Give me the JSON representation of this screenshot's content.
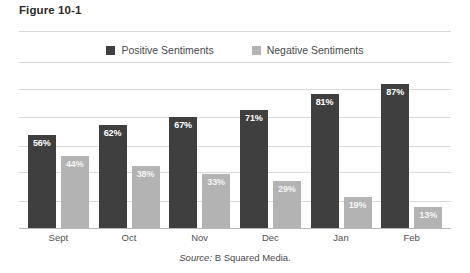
{
  "figure": {
    "title": "Figure 10-1",
    "source_keyword": "Source:",
    "source_text": " B Squared Media."
  },
  "colors": {
    "positive": "#3f3f3f",
    "negative": "#b3b3b3",
    "gridline": "#d9d9d9",
    "axis": "#b9b9b9",
    "background": "#ffffff",
    "label_text": "#ffffff"
  },
  "legend": {
    "items": [
      {
        "label": "Positive Sentiments",
        "color": "#3f3f3f",
        "swatch_name": "legend-swatch-positive"
      },
      {
        "label": "Negative Sentiments",
        "color": "#b3b3b3",
        "swatch_name": "legend-swatch-negative"
      }
    ]
  },
  "chart_data": {
    "type": "bar",
    "title": "Figure 10-1",
    "subtitle": "",
    "xlabel": "",
    "ylabel": "",
    "ylim": [
      0,
      100
    ],
    "grid": true,
    "gridline_values": [
      100,
      84,
      67,
      50,
      34,
      17
    ],
    "legend_position": "top-center",
    "categories": [
      "Sept",
      "Oct",
      "Nov",
      "Dec",
      "Jan",
      "Feb"
    ],
    "series": [
      {
        "name": "Positive Sentiments",
        "color": "#3f3f3f",
        "values": [
          56,
          62,
          67,
          71,
          81,
          87
        ],
        "labels": [
          "56%",
          "62%",
          "67%",
          "71%",
          "81%",
          "87%"
        ]
      },
      {
        "name": "Negative Sentiments",
        "color": "#b3b3b3",
        "values": [
          44,
          38,
          33,
          29,
          19,
          13
        ],
        "labels": [
          "44%",
          "38%",
          "33%",
          "29%",
          "19%",
          "13%"
        ]
      }
    ],
    "annotations": [
      "Source: B Squared Media."
    ]
  }
}
